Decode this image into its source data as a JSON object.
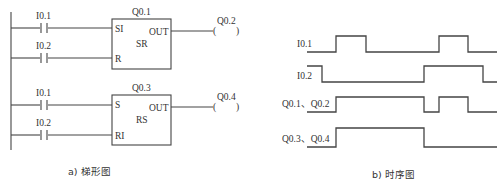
{
  "ladder": {
    "caption": "a) 梯形图",
    "blocks": [
      {
        "name": "Q0.1",
        "type": "SR",
        "inputs": [
          {
            "pin": "SI",
            "contact": "I0.1"
          },
          {
            "pin": "R",
            "contact": "I0.2"
          }
        ],
        "output_pin": "OUT",
        "coil": "Q0.2",
        "coil_symbol": "(   )"
      },
      {
        "name": "Q0.3",
        "type": "RS",
        "inputs": [
          {
            "pin": "S",
            "contact": "I0.1"
          },
          {
            "pin": "RI",
            "contact": "I0.2"
          }
        ],
        "output_pin": "OUT",
        "coil": "Q0.4",
        "coil_symbol": "(   )"
      }
    ]
  },
  "timing": {
    "caption": "b) 时序图",
    "signals": [
      {
        "label": "I0.1",
        "levels": "L H L H L"
      },
      {
        "label": "I0.2",
        "levels": "H L H L"
      },
      {
        "label": "Q0.1、Q0.2",
        "levels": "L H L H L"
      },
      {
        "label": "Q0.3、Q0.4",
        "levels": "L H L"
      }
    ]
  }
}
